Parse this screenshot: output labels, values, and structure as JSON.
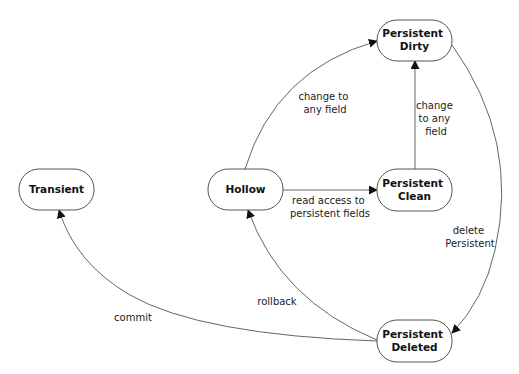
{
  "diagram": {
    "type": "state-transition",
    "nodes": [
      {
        "id": "transient",
        "lines": [
          "Transient"
        ]
      },
      {
        "id": "hollow",
        "lines": [
          "Hollow"
        ]
      },
      {
        "id": "persistent-clean",
        "lines": [
          "Persistent",
          "Clean"
        ]
      },
      {
        "id": "persistent-dirty",
        "lines": [
          "Persistent",
          "Dirty"
        ]
      },
      {
        "id": "persistent-deleted",
        "lines": [
          "Persistent",
          "Deleted"
        ]
      }
    ],
    "edges": [
      {
        "id": "hollow-to-clean",
        "from": "hollow",
        "to": "persistent-clean",
        "label": [
          "read access to",
          "persistent fields"
        ]
      },
      {
        "id": "hollow-to-dirty",
        "from": "hollow",
        "to": "persistent-dirty",
        "label": [
          "change to",
          "any field"
        ]
      },
      {
        "id": "clean-to-dirty",
        "from": "persistent-clean",
        "to": "persistent-dirty",
        "label": [
          "change",
          "to any",
          "field"
        ]
      },
      {
        "id": "dirty-to-deleted",
        "from": "persistent-dirty",
        "to": "persistent-deleted",
        "label": [
          "delete",
          "Persistent"
        ]
      },
      {
        "id": "deleted-to-hollow",
        "from": "persistent-deleted",
        "to": "hollow",
        "label": [
          "rollback"
        ]
      },
      {
        "id": "deleted-to-transient",
        "from": "persistent-deleted",
        "to": "transient",
        "label": [
          "commit"
        ]
      }
    ]
  }
}
